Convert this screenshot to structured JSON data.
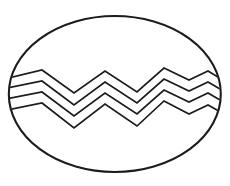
{
  "figure": {
    "background_color": "#ffffff",
    "line_color": "#1c1c1c",
    "canvas": {
      "width": 230,
      "height": 186
    },
    "egg_outline": {
      "cx": 114.8,
      "cy": 94,
      "rx": 106,
      "ry": 78,
      "stroke_width": 2.1
    },
    "zigzag_band": {
      "stroke_width": 1.7,
      "stripes": [
        {
          "points": "4,79 42,70 74,93 105,71 137,92 164,68 189,80 208,71 226,82"
        },
        {
          "points": "2,89 42,81 74,105 105,82 137,103 164,79 189,91 208,82 227,93"
        },
        {
          "points": "1,100 42,92 74,116 105,93 137,114 164,90 189,102 208,93 227,104"
        },
        {
          "points": "2,111 42,103 74,128 105,104 137,126 164,101 189,114 208,105 226,115"
        }
      ]
    }
  }
}
